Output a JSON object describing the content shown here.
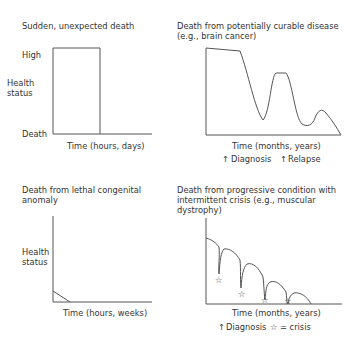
{
  "panels": [
    {
      "title": [
        "Sudden, unexpected death"
      ],
      "y_labels": {
        "high": "High",
        "axis_line1": "Health",
        "axis_line2": "status",
        "death": "Death"
      },
      "x_label": "Time (hours, days)"
    },
    {
      "title": [
        "Death from potentially curable disease",
        "(e.g., brain cancer)"
      ],
      "x_label": "Time (months, years)",
      "markers": [
        {
          "symbol": "↑",
          "label": "Diagnosis"
        },
        {
          "symbol": "↑",
          "label": "Relapse"
        }
      ]
    },
    {
      "title": [
        "Death from lethal congenital",
        "anomaly"
      ],
      "y_labels": {
        "axis_line1": "Health",
        "axis_line2": "status"
      },
      "x_label": "Time (hours, weeks)"
    },
    {
      "title": [
        "Death from progressive condition with",
        "intermittent crisis (e.g., muscular",
        "dystrophy)"
      ],
      "x_label": "Time (months, years)",
      "markers": [
        {
          "symbol": "↑",
          "label": "Diagnosis"
        },
        {
          "symbol": "☆",
          "label": "= crisis"
        }
      ],
      "crisis_symbol": "☆"
    }
  ]
}
